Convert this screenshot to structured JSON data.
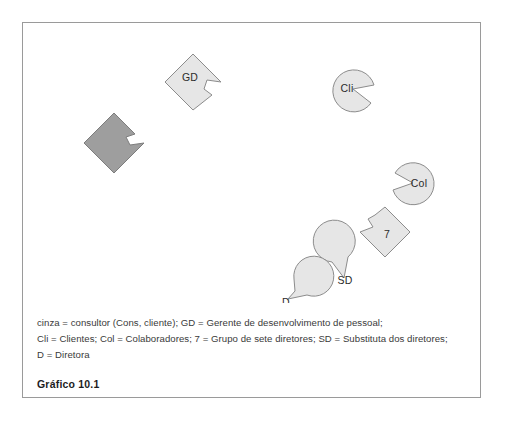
{
  "figure": {
    "caption": "Gráfico 10.1",
    "frame_color": "#9a9a9a",
    "background": "#ffffff"
  },
  "legend": {
    "lines": [
      "cinza = consultor (Cons, cliente); GD = Gerente de desenvolvimento de pessoal;",
      "Cli = Clientes; Col = Colaboradores; 7 = Grupo de sete diretores; SD = Substituta dos diretores;",
      "D = Diretora"
    ]
  },
  "colors": {
    "light_fill": "#e6e6e6",
    "dark_fill": "#9e9e9e",
    "stroke": "#8c8c8c",
    "label_text": "#2b2b2b"
  },
  "nodes": [
    {
      "id": "consultor",
      "label": "",
      "shape": "notched-diamond",
      "fill": "#9e9e9e",
      "cx": 91,
      "cy": 120,
      "size": 30,
      "notch": "top-right"
    },
    {
      "id": "gd",
      "label": "GD",
      "shape": "notched-diamond",
      "fill": "#e6e6e6",
      "cx": 170,
      "cy": 59,
      "size": 28,
      "notch": "bottom-right"
    },
    {
      "id": "cli",
      "label": "Cli",
      "shape": "pac-circle",
      "fill": "#e6e6e6",
      "cx": 330,
      "cy": 66,
      "r": 21,
      "notch": "right"
    },
    {
      "id": "col",
      "label": "Col",
      "shape": "pac-circle",
      "fill": "#e6e6e6",
      "cx": 390,
      "cy": 160,
      "r": 21,
      "notch": "upper-left"
    },
    {
      "id": "grupo7",
      "label": "7",
      "shape": "notched-diamond",
      "fill": "#e6e6e6",
      "cx": 362,
      "cy": 209,
      "size": 25,
      "notch": "upper-left"
    },
    {
      "id": "sd",
      "label": "SD",
      "shape": "pac-circle",
      "fill": "#e6e6e6",
      "cx": 321,
      "cy": 255,
      "r": 21,
      "notch": "top"
    },
    {
      "id": "d",
      "label": "D",
      "shape": "pac-circle",
      "fill": "#e6e6e6",
      "cx": 265,
      "cy": 276,
      "r": 20,
      "notch": "top-right"
    }
  ]
}
